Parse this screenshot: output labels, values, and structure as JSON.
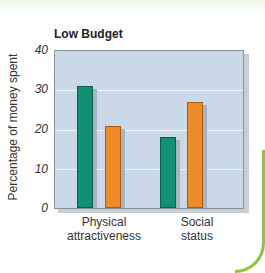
{
  "chart_data": {
    "type": "bar",
    "title": "Low Budget",
    "xlabel": "",
    "ylabel": "Percentage of money spent",
    "ylim": [
      0,
      40
    ],
    "yticks": [
      "0",
      "10",
      "20",
      "30",
      "40"
    ],
    "grid": true,
    "categories": [
      "Physical attractiveness",
      "Social status"
    ],
    "category_lines": [
      [
        "Physical",
        "attractiveness"
      ],
      [
        "Social",
        "status"
      ]
    ],
    "series": [
      {
        "name": "Series 1 (green)",
        "color": "#129074",
        "values": [
          31,
          18
        ]
      },
      {
        "name": "Series 2 (orange)",
        "color": "#ef8a28",
        "values": [
          21,
          27
        ]
      }
    ],
    "legend": null
  }
}
